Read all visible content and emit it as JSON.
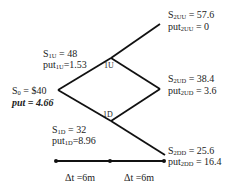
{
  "diagram": {
    "type": "binomial-tree",
    "nodes": {
      "root": {
        "S_prefix": "S",
        "S_sub": "0",
        "S_value": "= $40",
        "put_text": "put = 4.66"
      },
      "u1": {
        "tag": "1U",
        "S_prefix": "S",
        "S_sub": "1U",
        "S_value": " = 48",
        "put_prefix": "put",
        "put_sub": "1U",
        "put_value": "=1.53"
      },
      "d1": {
        "tag": "1D",
        "S_prefix": "S",
        "S_sub": "1D",
        "S_value": " = 32",
        "put_prefix": "put",
        "put_sub": "1D",
        "put_value": "=8.96"
      },
      "uu2": {
        "S_prefix": "S",
        "S_sub": "2UU",
        "S_value": " = 57.6",
        "put_prefix": "put",
        "put_sub": "2UU",
        "put_value": " = 0"
      },
      "ud2": {
        "S_prefix": "S",
        "S_sub": "2UD",
        "S_value": " = 38.4",
        "put_prefix": "put",
        "put_sub": "2UD",
        "put_value": " = 3.6"
      },
      "dd2": {
        "S_prefix": "S",
        "S_sub": "2DD",
        "S_value": " = 25.6",
        "put_prefix": "put",
        "put_sub": "2DD",
        "put_value": " = 16.4"
      }
    },
    "timeline": {
      "steps": [
        {
          "label": "Δt =6m"
        },
        {
          "label": "Δt =6m"
        }
      ]
    },
    "colors": {
      "line": "#111111",
      "text": "#222222"
    }
  }
}
